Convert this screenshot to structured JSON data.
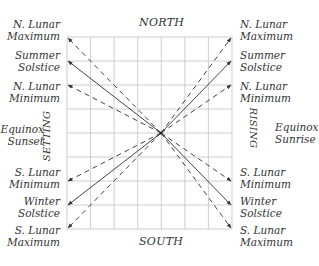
{
  "diagram": {
    "title_north": "NORTH",
    "title_south": "SOUTH",
    "side_left": "SETTING",
    "side_right": "RISING",
    "left_labels": [
      {
        "line1": "N. Lunar",
        "line2": "Maximum"
      },
      {
        "line1": "Summer",
        "line2": "Solstice"
      },
      {
        "line1": "N. Lunar",
        "line2": "Minimum"
      },
      {
        "line1": "Equinox",
        "line2": "Sunset"
      },
      {
        "line1": "S. Lunar",
        "line2": "Minimum"
      },
      {
        "line1": "Winter",
        "line2": "Solstice"
      },
      {
        "line1": "S. Lunar",
        "line2": "Maximum"
      }
    ],
    "right_labels": [
      {
        "line1": "N. Lunar",
        "line2": "Maximum"
      },
      {
        "line1": "Summer",
        "line2": "Solstice"
      },
      {
        "line1": "N. Lunar",
        "line2": "Minimum"
      },
      {
        "line1": "Equinox",
        "line2": "Sunrise"
      },
      {
        "line1": "S. Lunar",
        "line2": "Minimum"
      },
      {
        "line1": "Winter",
        "line2": "Solstice"
      },
      {
        "line1": "S. Lunar",
        "line2": "Maximum"
      }
    ],
    "grid": {
      "columns": 7,
      "rows": 8
    },
    "line_styles": {
      "solstice": "solid",
      "lunar": "dashed"
    },
    "colors": {
      "grid": "#c8c8c8",
      "lines": "#444444",
      "text": "#333333"
    }
  }
}
